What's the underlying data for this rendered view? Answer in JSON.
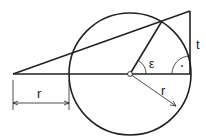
{
  "diagram": {
    "labels": {
      "tangent": "t",
      "angle": "ε",
      "radius_dim": "r",
      "radius_arrow": "r",
      "right_angle_dot": "·"
    },
    "colors": {
      "stroke": "#222222",
      "background": "#ffffff"
    }
  }
}
